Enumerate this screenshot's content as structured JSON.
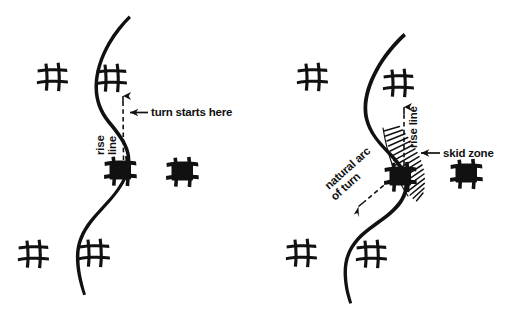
{
  "figure": {
    "background_color": "#ffffff",
    "ink_color": "#111111",
    "width": 523,
    "height": 313,
    "panels": [
      {
        "id": "left",
        "name": "turn-start-panel",
        "labels": [
          {
            "id": "turn-starts-here",
            "text": "turn starts here",
            "orientation": "horizontal",
            "arrow": "left"
          },
          {
            "id": "rise",
            "text": "rise",
            "orientation": "vertical-ccw",
            "arrow": "none"
          },
          {
            "id": "line",
            "text": "line",
            "orientation": "vertical-ccw",
            "arrow": "none"
          }
        ],
        "gates": [
          {
            "id": "gate-l1",
            "style": "outline",
            "x": 52,
            "y": 77
          },
          {
            "id": "gate-l2",
            "style": "outline",
            "x": 111,
            "y": 78
          },
          {
            "id": "gate-l3",
            "style": "filled",
            "x": 120,
            "y": 171
          },
          {
            "id": "gate-l4",
            "style": "filled",
            "x": 182,
            "y": 172
          },
          {
            "id": "gate-l5",
            "style": "outline",
            "x": 33,
            "y": 254
          },
          {
            "id": "gate-l6",
            "style": "outline",
            "x": 94,
            "y": 253
          }
        ],
        "track_line": "S-curve",
        "rise_line_style": "dashed with up arrow"
      },
      {
        "id": "right",
        "name": "skid-zone-panel",
        "labels": [
          {
            "id": "skid-zone",
            "text": "skid zone",
            "orientation": "horizontal",
            "arrow": "left"
          },
          {
            "id": "rise-line-right",
            "text": "rise line",
            "orientation": "vertical-ccw",
            "arrow": "none"
          },
          {
            "id": "natural-arc",
            "text": "natural arc",
            "orientation": "diagonal",
            "arrow": "none"
          },
          {
            "id": "of-turn",
            "text": "of turn",
            "orientation": "diagonal",
            "arrow": "none"
          }
        ],
        "gates": [
          {
            "id": "gate-r1",
            "style": "outline",
            "x": 312,
            "y": 77
          },
          {
            "id": "gate-r2",
            "style": "outline",
            "x": 398,
            "y": 83
          },
          {
            "id": "gate-r3",
            "style": "filled",
            "x": 400,
            "y": 177
          },
          {
            "id": "gate-r4",
            "style": "filled",
            "x": 466,
            "y": 174
          },
          {
            "id": "gate-r5",
            "style": "outline",
            "x": 301,
            "y": 253
          },
          {
            "id": "gate-r6",
            "style": "outline",
            "x": 371,
            "y": 254
          }
        ],
        "track_line": "S-curve",
        "rise_line_style": "dashed with up arrow",
        "natural_arc_style": "dashed with down-left arrow",
        "skid_zone_style": "hatched crescent"
      }
    ]
  }
}
